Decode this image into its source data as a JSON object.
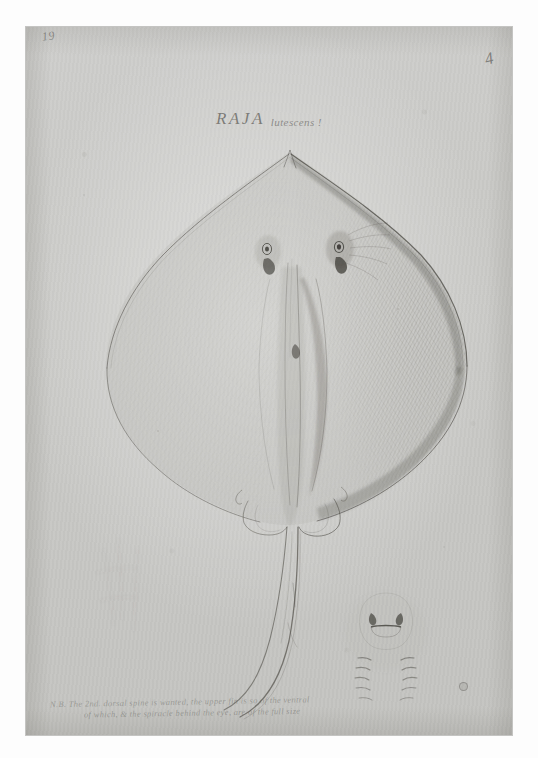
{
  "plate": {
    "medium": "graphite pencil drawing on aged laid paper",
    "background_color": "#ffffff",
    "paper_color": "#c9c9c6",
    "ink_color": "#56544e"
  },
  "corner_marks": {
    "top_left_number": "19",
    "top_right_number": "4"
  },
  "title": {
    "genus": "RAJA",
    "species": "lutescens !"
  },
  "subject": {
    "common_name": "stingray",
    "view": "dorsal",
    "features": [
      "pointed snout",
      "left pectoral wing",
      "right pectoral wing with dense hatching",
      "left eye",
      "right eye",
      "left spiracle",
      "right spiracle",
      "dorsal midline ridge",
      "left pelvic fin",
      "right pelvic fin",
      "long whip tail"
    ]
  },
  "detail_sketch": {
    "label": "ventral mouth and gill-slit study",
    "elements": [
      "mouth",
      "left nostril",
      "right nostril",
      "left gill slits",
      "right gill slits"
    ]
  },
  "faint_sketch": {
    "label": "erased preliminary study"
  },
  "inscription": {
    "line_1": "N.B. The 2nd. dorsal spine is wanted, the upper fin is so of the ventral",
    "line_2": "of which, & the spiracle behind the eye, are of the full size"
  },
  "stamp": {
    "label": "collection stamp"
  }
}
